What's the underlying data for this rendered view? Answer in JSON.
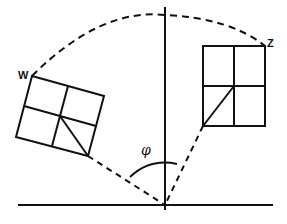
{
  "diagram": {
    "type": "rotation-geometry",
    "labels": {
      "w": "W",
      "z": "Z",
      "angle": "φ"
    },
    "colors": {
      "stroke": "#111111",
      "background": "#ffffff"
    },
    "elements": {
      "left_square": "rotated 2x2 grid with diagonal in lower-right cell, corner W",
      "right_rectangle": "upright 2x2 grid with diagonal in lower-left cell, corner Z",
      "arc": "dashed arc from W to Z over the vertical axis",
      "radii": "dashed lines from pivot to each figure's bottom corner",
      "angle_arc": "solid arc marking angle φ"
    }
  }
}
